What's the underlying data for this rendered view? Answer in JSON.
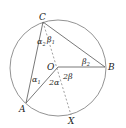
{
  "diagram": {
    "points": {
      "C": {
        "label": "C",
        "x": 43,
        "y": 22
      },
      "B": {
        "label": "B",
        "x": 105,
        "y": 67
      },
      "A": {
        "label": "A",
        "x": 26,
        "y": 103
      },
      "X": {
        "label": "X",
        "x": 71,
        "y": 115
      },
      "O": {
        "label": "O",
        "x": 58,
        "y": 67
      }
    },
    "circle": {
      "cx": 58,
      "cy": 68,
      "r": 48
    },
    "angles": {
      "alpha2": "α",
      "alpha2_sub": "2",
      "beta1": "β",
      "beta1_sub": "1",
      "alpha1": "α",
      "alpha1_sub": "1",
      "beta2": "β",
      "beta2_sub": "2",
      "two_alpha": "2α",
      "two_beta": "2β"
    },
    "colors": {
      "stroke": "#666666",
      "text": "#222222"
    }
  }
}
